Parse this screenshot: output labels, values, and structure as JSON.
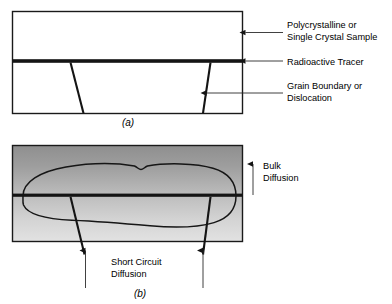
{
  "figure": {
    "panels": [
      {
        "id": "a",
        "caption": "(a)",
        "kind": "before-diffusion",
        "labels": [
          {
            "name": "sample",
            "lines": [
              "Polycrystalline or",
              "Single Crystal Sample"
            ]
          },
          {
            "name": "tracer",
            "lines": [
              "Radioactive Tracer"
            ]
          },
          {
            "name": "grain-boundary",
            "lines": [
              "Grain Boundary or",
              "Dislocation"
            ]
          }
        ]
      },
      {
        "id": "b",
        "caption": "(b)",
        "kind": "after-diffusion",
        "labels": [
          {
            "name": "bulk-diffusion",
            "lines": [
              "Bulk",
              "Diffusion"
            ]
          },
          {
            "name": "short-circuit-diffusion",
            "lines": [
              "Short Circuit",
              "Diffusion"
            ]
          }
        ]
      }
    ],
    "colors": {
      "ink": "#141414",
      "border": "#1a1a1a",
      "leader": "#2b2b2b",
      "gradient_top": "#9a9a9a",
      "gradient_mid": "#b9b9b9",
      "gradient_bottom": "#dedede",
      "background": "#ffffff"
    }
  }
}
